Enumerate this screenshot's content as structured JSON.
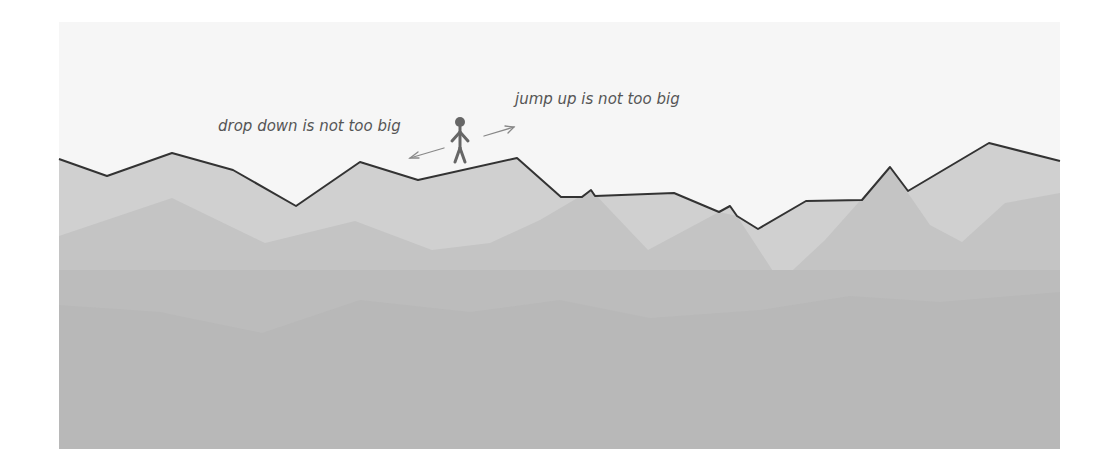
{
  "annotations": {
    "drop_label": "drop down is not too big",
    "jump_label": "jump up is not too big"
  },
  "colors": {
    "sky": "#f6f6f6",
    "layer_front": "#d0d0d0",
    "layer_mid": "#c3c3c3",
    "layer_back": "#bbbbbb",
    "layer_base": "#b6b6b6",
    "ridge_line": "#333333",
    "figure": "#666666",
    "arrow": "#888888",
    "text": "#555555"
  },
  "frame": {
    "x": 59,
    "y": 22,
    "width": 1001,
    "height": 427
  },
  "ridge_points": [
    [
      59,
      159
    ],
    [
      107,
      176
    ],
    [
      172,
      153
    ],
    [
      233,
      170
    ],
    [
      296,
      206
    ],
    [
      360,
      162
    ],
    [
      418,
      180
    ],
    [
      517,
      158
    ],
    [
      561,
      197
    ],
    [
      582,
      197
    ],
    [
      591,
      190
    ],
    [
      595,
      196
    ],
    [
      674,
      193
    ],
    [
      719,
      212
    ],
    [
      730,
      206
    ],
    [
      737,
      216
    ],
    [
      758,
      229
    ],
    [
      806,
      201
    ],
    [
      862,
      200
    ],
    [
      890,
      167
    ],
    [
      908,
      191
    ],
    [
      989,
      143
    ],
    [
      1060,
      161
    ]
  ]
}
